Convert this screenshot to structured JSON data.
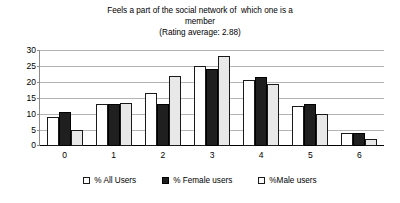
{
  "chart_data": {
    "type": "bar",
    "title": "Feels a part of the social network of  which one is a member\n(Rating average: 2.88)",
    "title_lines": [
      "Feels a part of the social network of  which one is a",
      "member",
      "(Rating average: 2.88)"
    ],
    "rating_average": 2.88,
    "xlabel": "",
    "ylabel": "",
    "categories": [
      "0",
      "1",
      "2",
      "3",
      "4",
      "5",
      "6"
    ],
    "series": [
      {
        "name": "% All Users",
        "values": [
          9,
          13,
          16.5,
          25,
          20.5,
          12.5,
          4
        ],
        "color": "#ffffff"
      },
      {
        "name": "% Female users",
        "values": [
          10.5,
          13,
          13,
          24,
          21.5,
          13,
          4.2
        ],
        "color": "#1f1f1f"
      },
      {
        "name": "%Male users",
        "values": [
          5,
          13.5,
          22,
          28,
          19.5,
          10,
          2.2
        ],
        "color": "#e8e8e8"
      }
    ],
    "ylim": [
      0,
      30
    ],
    "y_ticks": [
      0,
      5,
      10,
      15,
      20,
      25,
      30
    ],
    "y_tick_labels": [
      "0",
      "5",
      "10",
      "15",
      "20",
      "25",
      "30"
    ],
    "grid": true,
    "grid_color": "#b4b4b4",
    "legend_position": "bottom",
    "legend": [
      {
        "label": "% All Users",
        "marker": "open-square-white"
      },
      {
        "label": "% Female users",
        "marker": "filled-square-black"
      },
      {
        "label": "%Male users",
        "marker": "open-square-light"
      }
    ]
  }
}
